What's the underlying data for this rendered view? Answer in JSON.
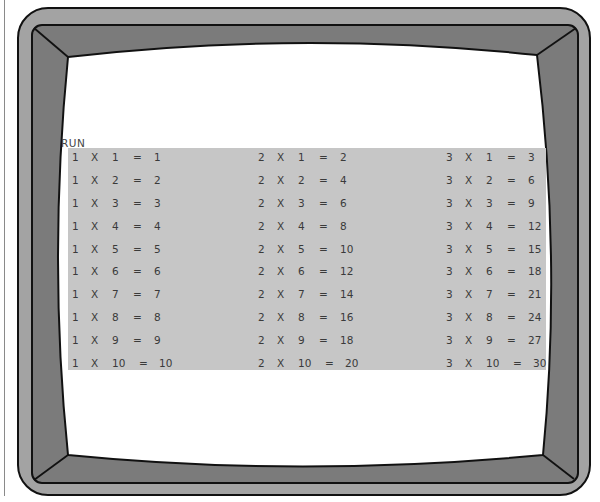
{
  "monitor": {
    "frame_color": "#a3a3a3",
    "bezel_color": "#7b7b7b",
    "outline_color": "#111111",
    "screen_color": "#ffffff",
    "panel_color": "#c6c6c6",
    "text_color": "#3a3a3a"
  },
  "terminal": {
    "command": "RUN",
    "tables": [
      {
        "multiplier": 1,
        "rows": [
          {
            "a": "1",
            "op": "X",
            "b": "1",
            "eq": "=",
            "result": "1"
          },
          {
            "a": "1",
            "op": "X",
            "b": "2",
            "eq": "=",
            "result": "2"
          },
          {
            "a": "1",
            "op": "X",
            "b": "3",
            "eq": "=",
            "result": "3"
          },
          {
            "a": "1",
            "op": "X",
            "b": "4",
            "eq": "=",
            "result": "4"
          },
          {
            "a": "1",
            "op": "X",
            "b": "5",
            "eq": "=",
            "result": "5"
          },
          {
            "a": "1",
            "op": "X",
            "b": "6",
            "eq": "=",
            "result": "6"
          },
          {
            "a": "1",
            "op": "X",
            "b": "7",
            "eq": "=",
            "result": "7"
          },
          {
            "a": "1",
            "op": "X",
            "b": "8",
            "eq": "=",
            "result": "8"
          },
          {
            "a": "1",
            "op": "X",
            "b": "9",
            "eq": "=",
            "result": "9"
          },
          {
            "a": "1",
            "op": "X",
            "b": "10",
            "eq": "=",
            "result": "10"
          }
        ]
      },
      {
        "multiplier": 2,
        "rows": [
          {
            "a": "2",
            "op": "X",
            "b": "1",
            "eq": "=",
            "result": "2"
          },
          {
            "a": "2",
            "op": "X",
            "b": "2",
            "eq": "=",
            "result": "4"
          },
          {
            "a": "2",
            "op": "X",
            "b": "3",
            "eq": "=",
            "result": "6"
          },
          {
            "a": "2",
            "op": "X",
            "b": "4",
            "eq": "=",
            "result": "8"
          },
          {
            "a": "2",
            "op": "X",
            "b": "5",
            "eq": "=",
            "result": "10"
          },
          {
            "a": "2",
            "op": "X",
            "b": "6",
            "eq": "=",
            "result": "12"
          },
          {
            "a": "2",
            "op": "X",
            "b": "7",
            "eq": "=",
            "result": "14"
          },
          {
            "a": "2",
            "op": "X",
            "b": "8",
            "eq": "=",
            "result": "16"
          },
          {
            "a": "2",
            "op": "X",
            "b": "9",
            "eq": "=",
            "result": "18"
          },
          {
            "a": "2",
            "op": "X",
            "b": "10",
            "eq": "=",
            "result": "20"
          }
        ]
      },
      {
        "multiplier": 3,
        "rows": [
          {
            "a": "3",
            "op": "X",
            "b": "1",
            "eq": "=",
            "result": "3"
          },
          {
            "a": "3",
            "op": "X",
            "b": "2",
            "eq": "=",
            "result": "6"
          },
          {
            "a": "3",
            "op": "X",
            "b": "3",
            "eq": "=",
            "result": "9"
          },
          {
            "a": "3",
            "op": "X",
            "b": "4",
            "eq": "=",
            "result": "12"
          },
          {
            "a": "3",
            "op": "X",
            "b": "5",
            "eq": "=",
            "result": "15"
          },
          {
            "a": "3",
            "op": "X",
            "b": "6",
            "eq": "=",
            "result": "18"
          },
          {
            "a": "3",
            "op": "X",
            "b": "7",
            "eq": "=",
            "result": "21"
          },
          {
            "a": "3",
            "op": "X",
            "b": "8",
            "eq": "=",
            "result": "24"
          },
          {
            "a": "3",
            "op": "X",
            "b": "9",
            "eq": "=",
            "result": "27"
          },
          {
            "a": "3",
            "op": "X",
            "b": "10",
            "eq": "=",
            "result": "30"
          }
        ]
      }
    ]
  }
}
